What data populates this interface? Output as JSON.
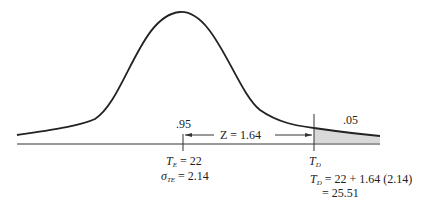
{
  "diagram": {
    "type": "normal-distribution",
    "labels": {
      "left_area": ".95",
      "right_area": ".05",
      "z_label": "Z = 1.64",
      "te_symbol": "T",
      "te_sub": "E",
      "te_value": " = 22",
      "sigma_symbol": "σ",
      "sigma_sub": "TE",
      "sigma_value": " = 2.14",
      "td_symbol": "T",
      "td_sub": "D",
      "td_eq_symbol": "T",
      "td_eq_sub": "D",
      "td_eq_rest": " = 22 + 1.64 (2.14)",
      "td_result": "= 25.51"
    },
    "colors": {
      "line": "#222222",
      "shade": "#d9d9d9"
    }
  }
}
